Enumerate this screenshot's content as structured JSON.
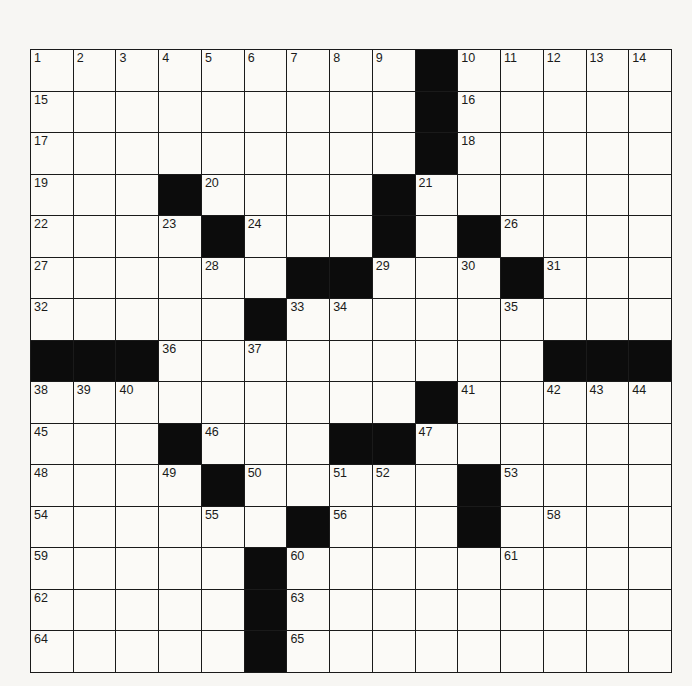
{
  "puzzle": {
    "rows": 15,
    "cols": 15,
    "colors": {
      "black": "#0c0c0c",
      "white": "#fbfaf7",
      "line": "#1a1a1a"
    },
    "layout": [
      "#########.#####",
      "#########.#####",
      "#########.#####",
      "###.####.######",
      "####.###.#.####",
      "######..###.###",
      "#####.#########",
      "...#########...",
      "#########.#####",
      "###.###..######",
      "####.#####.####",
      "######.###.####",
      "#####.#########",
      "#####.#########",
      "#####.#########"
    ],
    "numbers": [
      {
        "r": 0,
        "c": 0,
        "n": "1"
      },
      {
        "r": 0,
        "c": 1,
        "n": "2"
      },
      {
        "r": 0,
        "c": 2,
        "n": "3"
      },
      {
        "r": 0,
        "c": 3,
        "n": "4"
      },
      {
        "r": 0,
        "c": 4,
        "n": "5"
      },
      {
        "r": 0,
        "c": 5,
        "n": "6"
      },
      {
        "r": 0,
        "c": 6,
        "n": "7"
      },
      {
        "r": 0,
        "c": 7,
        "n": "8"
      },
      {
        "r": 0,
        "c": 8,
        "n": "9"
      },
      {
        "r": 0,
        "c": 10,
        "n": "10"
      },
      {
        "r": 0,
        "c": 11,
        "n": "11"
      },
      {
        "r": 0,
        "c": 12,
        "n": "12"
      },
      {
        "r": 0,
        "c": 13,
        "n": "13"
      },
      {
        "r": 0,
        "c": 14,
        "n": "14"
      },
      {
        "r": 1,
        "c": 0,
        "n": "15"
      },
      {
        "r": 1,
        "c": 10,
        "n": "16"
      },
      {
        "r": 2,
        "c": 0,
        "n": "17"
      },
      {
        "r": 2,
        "c": 10,
        "n": "18"
      },
      {
        "r": 3,
        "c": 0,
        "n": "19"
      },
      {
        "r": 3,
        "c": 4,
        "n": "20"
      },
      {
        "r": 3,
        "c": 9,
        "n": "21"
      },
      {
        "r": 4,
        "c": 0,
        "n": "22"
      },
      {
        "r": 4,
        "c": 3,
        "n": "23"
      },
      {
        "r": 4,
        "c": 5,
        "n": "24"
      },
      {
        "r": 4,
        "c": 8,
        "n": "25"
      },
      {
        "r": 4,
        "c": 11,
        "n": "26"
      },
      {
        "r": 5,
        "c": 0,
        "n": "27"
      },
      {
        "r": 5,
        "c": 4,
        "n": "28"
      },
      {
        "r": 5,
        "c": 8,
        "n": "29"
      },
      {
        "r": 5,
        "c": 10,
        "n": "30"
      },
      {
        "r": 5,
        "c": 12,
        "n": "31"
      },
      {
        "r": 6,
        "c": 0,
        "n": "32"
      },
      {
        "r": 6,
        "c": 6,
        "n": "33"
      },
      {
        "r": 6,
        "c": 7,
        "n": "34"
      },
      {
        "r": 6,
        "c": 11,
        "n": "35"
      },
      {
        "r": 7,
        "c": 3,
        "n": "36"
      },
      {
        "r": 7,
        "c": 5,
        "n": "37"
      },
      {
        "r": 8,
        "c": 0,
        "n": "38"
      },
      {
        "r": 8,
        "c": 1,
        "n": "39"
      },
      {
        "r": 8,
        "c": 2,
        "n": "40"
      },
      {
        "r": 8,
        "c": 10,
        "n": "41"
      },
      {
        "r": 8,
        "c": 12,
        "n": "42"
      },
      {
        "r": 8,
        "c": 13,
        "n": "43"
      },
      {
        "r": 8,
        "c": 14,
        "n": "44"
      },
      {
        "r": 9,
        "c": 0,
        "n": "45"
      },
      {
        "r": 9,
        "c": 4,
        "n": "46"
      },
      {
        "r": 9,
        "c": 9,
        "n": "47"
      },
      {
        "r": 10,
        "c": 0,
        "n": "48"
      },
      {
        "r": 10,
        "c": 3,
        "n": "49"
      },
      {
        "r": 10,
        "c": 5,
        "n": "50"
      },
      {
        "r": 10,
        "c": 7,
        "n": "51"
      },
      {
        "r": 10,
        "c": 8,
        "n": "52"
      },
      {
        "r": 10,
        "c": 11,
        "n": "53"
      },
      {
        "r": 11,
        "c": 0,
        "n": "54"
      },
      {
        "r": 11,
        "c": 4,
        "n": "55"
      },
      {
        "r": 11,
        "c": 7,
        "n": "56"
      },
      {
        "r": 11,
        "c": 10,
        "n": "57"
      },
      {
        "r": 11,
        "c": 12,
        "n": "58"
      },
      {
        "r": 12,
        "c": 0,
        "n": "59"
      },
      {
        "r": 12,
        "c": 6,
        "n": "60"
      },
      {
        "r": 12,
        "c": 11,
        "n": "61"
      },
      {
        "r": 13,
        "c": 0,
        "n": "62"
      },
      {
        "r": 13,
        "c": 6,
        "n": "63"
      },
      {
        "r": 14,
        "c": 0,
        "n": "64"
      },
      {
        "r": 14,
        "c": 6,
        "n": "65"
      }
    ]
  }
}
